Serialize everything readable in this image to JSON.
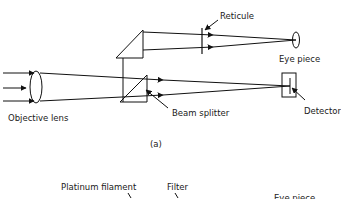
{
  "figure_a": {
    "labels": {
      "reticule": "Reticule",
      "eye_piece": "Eye piece",
      "objective_lens": "Objective lens",
      "beam_splitter": "Beam splitter",
      "detector": "Detector"
    },
    "caption": "(a)"
  },
  "figure_b": {
    "labels": {
      "platinum_filament": "Platinum filament",
      "filter": "Filter",
      "eye_piece": "Eye piece"
    }
  },
  "colors": {
    "line": "#111111",
    "background": "#ffffff"
  }
}
